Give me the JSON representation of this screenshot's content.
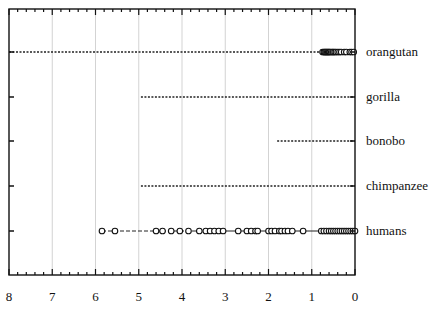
{
  "chart_data": {
    "type": "scatter",
    "title": "",
    "xlabel": "",
    "ylabel": "",
    "xlim": [
      8,
      0
    ],
    "x_reversed": true,
    "x_ticks": [
      8,
      7,
      6,
      5,
      4,
      3,
      2,
      1,
      0
    ],
    "x_minor_ticks_per_major": 5,
    "grid": {
      "vertical": true,
      "horizontal": false
    },
    "categories": [
      "orangutan",
      "gorilla",
      "bonobo",
      "chimpanzee",
      "humans"
    ],
    "series": [
      {
        "name": "orangutan",
        "range_line": {
          "from": 8,
          "to": 0,
          "style": "dotted"
        },
        "points": [
          0.75,
          0.72,
          0.7,
          0.68,
          0.66,
          0.64,
          0.62,
          0.6,
          0.58,
          0.55,
          0.52,
          0.5,
          0.47,
          0.44,
          0.4,
          0.36,
          0.32,
          0.25,
          0.2,
          0.12,
          0.08,
          0.03
        ]
      },
      {
        "name": "gorilla",
        "range_line": {
          "from": 4.95,
          "to": 0,
          "style": "dotted"
        },
        "points": []
      },
      {
        "name": "bonobo",
        "range_line": {
          "from": 1.8,
          "to": 0,
          "style": "dotted"
        },
        "points": []
      },
      {
        "name": "chimpanzee",
        "range_line": {
          "from": 4.95,
          "to": 0,
          "style": "dotted"
        },
        "points": []
      },
      {
        "name": "humans",
        "range_line": {
          "from": 5.85,
          "to": 0,
          "style": "dashed-to-solid"
        },
        "points": [
          5.85,
          5.55,
          4.6,
          4.45,
          4.25,
          4.05,
          3.85,
          3.6,
          3.45,
          3.35,
          3.25,
          3.15,
          3.05,
          2.7,
          2.5,
          2.4,
          2.3,
          2.25,
          2.0,
          1.93,
          1.85,
          1.75,
          1.7,
          1.62,
          1.55,
          1.45,
          1.2,
          0.78,
          0.72,
          0.66,
          0.6,
          0.55,
          0.5,
          0.45,
          0.4,
          0.35,
          0.3,
          0.25,
          0.2,
          0.15,
          0.1,
          0.05,
          0.0
        ]
      }
    ],
    "legend": null
  },
  "plot": {
    "frame": {
      "left": 9,
      "top": 9,
      "right": 355,
      "bottom": 275
    },
    "row_y": {
      "orangutan": 52,
      "gorilla": 97,
      "bonobo": 141,
      "chimpanzee": 186,
      "humans": 231
    },
    "colors": {
      "axis": "#111111",
      "grid": "#c8c8c8",
      "line": "#222222",
      "marker_fill": "#ffffff",
      "marker_stroke": "#111111"
    }
  }
}
